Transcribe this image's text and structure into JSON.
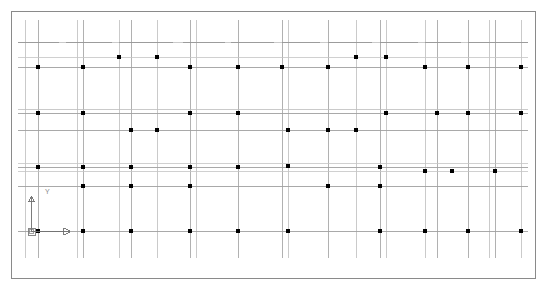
{
  "app": {
    "title": "CAD Structural Grid Drawing",
    "viewport_label": "model-space-viewport",
    "background_color": "#ffffff"
  },
  "viewport": {
    "width": 546,
    "height": 295,
    "border": {
      "x": 11,
      "y": 11,
      "width": 524,
      "height": 267,
      "color": "#8a8a8a",
      "stroke_width": 1
    }
  },
  "style": {
    "grid_line_color": "#b9b9b9",
    "beam_line_color": "#909090",
    "secondary_line_color": "#c9c9c9",
    "column_marker_color": "#000000",
    "ucs_icon_color": "#7a7a7a",
    "ucs_axis_color": "#6e6e6e"
  },
  "ucs_icon": {
    "name": "ucs-coordinate-icon",
    "origin_x": 31,
    "origin_y": 231,
    "x_axis_length": 38,
    "y_axis_length": 36,
    "x_label": "",
    "y_label": "Y",
    "label_y_x": 45,
    "label_y_y": 194
  },
  "grid": {
    "vertical_lines": [
      {
        "x": 25,
        "y1": 20,
        "y2": 258,
        "w": 0.8,
        "c": "#bdbdbd"
      },
      {
        "x": 38,
        "y1": 20,
        "y2": 258,
        "w": 0.9,
        "c": "#a8a8a8"
      },
      {
        "x": 77,
        "y1": 20,
        "y2": 258,
        "w": 0.8,
        "c": "#bdbdbd"
      },
      {
        "x": 83,
        "y1": 20,
        "y2": 258,
        "w": 0.9,
        "c": "#a8a8a8"
      },
      {
        "x": 119,
        "y1": 20,
        "y2": 258,
        "w": 0.8,
        "c": "#bdbdbd"
      },
      {
        "x": 131,
        "y1": 20,
        "y2": 258,
        "w": 0.9,
        "c": "#a8a8a8"
      },
      {
        "x": 157,
        "y1": 20,
        "y2": 258,
        "w": 0.8,
        "c": "#bdbdbd"
      },
      {
        "x": 190,
        "y1": 20,
        "y2": 258,
        "w": 0.9,
        "c": "#a8a8a8"
      },
      {
        "x": 196,
        "y1": 20,
        "y2": 258,
        "w": 0.8,
        "c": "#bdbdbd"
      },
      {
        "x": 238,
        "y1": 20,
        "y2": 258,
        "w": 0.9,
        "c": "#a8a8a8"
      },
      {
        "x": 282,
        "y1": 20,
        "y2": 258,
        "w": 0.9,
        "c": "#a8a8a8"
      },
      {
        "x": 288,
        "y1": 20,
        "y2": 258,
        "w": 0.8,
        "c": "#bdbdbd"
      },
      {
        "x": 328,
        "y1": 20,
        "y2": 258,
        "w": 0.9,
        "c": "#a8a8a8"
      },
      {
        "x": 356,
        "y1": 20,
        "y2": 258,
        "w": 0.8,
        "c": "#bdbdbd"
      },
      {
        "x": 380,
        "y1": 20,
        "y2": 258,
        "w": 0.9,
        "c": "#a8a8a8"
      },
      {
        "x": 386,
        "y1": 20,
        "y2": 258,
        "w": 0.8,
        "c": "#bdbdbd"
      },
      {
        "x": 425,
        "y1": 20,
        "y2": 258,
        "w": 0.8,
        "c": "#bdbdbd"
      },
      {
        "x": 437,
        "y1": 20,
        "y2": 258,
        "w": 0.9,
        "c": "#a8a8a8"
      },
      {
        "x": 468,
        "y1": 20,
        "y2": 258,
        "w": 0.9,
        "c": "#a8a8a8"
      },
      {
        "x": 489,
        "y1": 20,
        "y2": 258,
        "w": 0.8,
        "c": "#bdbdbd"
      },
      {
        "x": 495,
        "y1": 20,
        "y2": 258,
        "w": 0.9,
        "c": "#a8a8a8"
      },
      {
        "x": 521,
        "y1": 20,
        "y2": 258,
        "w": 0.8,
        "c": "#bdbdbd"
      }
    ],
    "horizontal_lines": [
      {
        "y": 42,
        "x1": 18,
        "x2": 528,
        "w": 0.8,
        "c": "#bdbdbd"
      },
      {
        "y": 57,
        "x1": 18,
        "x2": 528,
        "w": 0.8,
        "c": "#c4c4c4"
      },
      {
        "y": 67,
        "x1": 18,
        "x2": 528,
        "w": 0.9,
        "c": "#a0a0a0"
      },
      {
        "y": 109,
        "x1": 18,
        "x2": 528,
        "w": 0.8,
        "c": "#bdbdbd"
      },
      {
        "y": 113,
        "x1": 18,
        "x2": 528,
        "w": 0.9,
        "c": "#a0a0a0"
      },
      {
        "y": 130,
        "x1": 18,
        "x2": 528,
        "w": 0.9,
        "c": "#a0a0a0"
      },
      {
        "y": 163,
        "x1": 18,
        "x2": 528,
        "w": 0.8,
        "c": "#c4c4c4"
      },
      {
        "y": 167,
        "x1": 18,
        "x2": 528,
        "w": 0.9,
        "c": "#a0a0a0"
      },
      {
        "y": 171,
        "x1": 18,
        "x2": 528,
        "w": 0.8,
        "c": "#c4c4c4"
      },
      {
        "y": 186,
        "x1": 18,
        "x2": 528,
        "w": 0.9,
        "c": "#a0a0a0"
      },
      {
        "y": 231,
        "x1": 18,
        "x2": 528,
        "w": 0.9,
        "c": "#a0a0a0"
      }
    ],
    "column_markers": [
      {
        "x": 38,
        "y": 67
      },
      {
        "x": 83,
        "y": 67
      },
      {
        "x": 119,
        "y": 57
      },
      {
        "x": 157,
        "y": 57
      },
      {
        "x": 190,
        "y": 67
      },
      {
        "x": 238,
        "y": 67
      },
      {
        "x": 282,
        "y": 67
      },
      {
        "x": 328,
        "y": 67
      },
      {
        "x": 356,
        "y": 57
      },
      {
        "x": 386,
        "y": 57
      },
      {
        "x": 425,
        "y": 67
      },
      {
        "x": 468,
        "y": 67
      },
      {
        "x": 521,
        "y": 67
      },
      {
        "x": 38,
        "y": 113
      },
      {
        "x": 83,
        "y": 113
      },
      {
        "x": 131,
        "y": 130
      },
      {
        "x": 157,
        "y": 130
      },
      {
        "x": 190,
        "y": 113
      },
      {
        "x": 238,
        "y": 113
      },
      {
        "x": 288,
        "y": 130
      },
      {
        "x": 328,
        "y": 130
      },
      {
        "x": 356,
        "y": 130
      },
      {
        "x": 386,
        "y": 113
      },
      {
        "x": 437,
        "y": 113
      },
      {
        "x": 468,
        "y": 113
      },
      {
        "x": 521,
        "y": 113
      },
      {
        "x": 38,
        "y": 167
      },
      {
        "x": 83,
        "y": 167
      },
      {
        "x": 131,
        "y": 167
      },
      {
        "x": 190,
        "y": 167
      },
      {
        "x": 238,
        "y": 167
      },
      {
        "x": 288,
        "y": 166
      },
      {
        "x": 380,
        "y": 167
      },
      {
        "x": 425,
        "y": 171
      },
      {
        "x": 452,
        "y": 171
      },
      {
        "x": 495,
        "y": 171
      },
      {
        "x": 83,
        "y": 186
      },
      {
        "x": 131,
        "y": 186
      },
      {
        "x": 190,
        "y": 186
      },
      {
        "x": 328,
        "y": 186
      },
      {
        "x": 380,
        "y": 186
      },
      {
        "x": 38,
        "y": 231
      },
      {
        "x": 83,
        "y": 231
      },
      {
        "x": 131,
        "y": 231
      },
      {
        "x": 190,
        "y": 231
      },
      {
        "x": 238,
        "y": 231
      },
      {
        "x": 288,
        "y": 231
      },
      {
        "x": 380,
        "y": 231
      },
      {
        "x": 425,
        "y": 231
      },
      {
        "x": 468,
        "y": 231
      },
      {
        "x": 521,
        "y": 231
      }
    ],
    "beam_segments": [
      {
        "x1": 18,
        "y1": 42,
        "x2": 59,
        "y2": 42
      },
      {
        "x1": 66,
        "y1": 42,
        "x2": 112,
        "y2": 42
      },
      {
        "x1": 119,
        "y1": 42,
        "x2": 173,
        "y2": 42
      },
      {
        "x1": 183,
        "y1": 42,
        "x2": 225,
        "y2": 42
      },
      {
        "x1": 231,
        "y1": 42,
        "x2": 274,
        "y2": 42
      },
      {
        "x1": 282,
        "y1": 42,
        "x2": 320,
        "y2": 42
      },
      {
        "x1": 328,
        "y1": 42,
        "x2": 372,
        "y2": 42
      },
      {
        "x1": 380,
        "y1": 42,
        "x2": 418,
        "y2": 42
      },
      {
        "x1": 425,
        "y1": 42,
        "x2": 461,
        "y2": 42
      },
      {
        "x1": 468,
        "y1": 42,
        "x2": 513,
        "y2": 42
      },
      {
        "x1": 513,
        "y1": 42,
        "x2": 528,
        "y2": 42
      }
    ],
    "row_bands": [
      {
        "label": "band-1-roof",
        "y_top": 42,
        "y_bottom": 67
      },
      {
        "label": "band-2-level3",
        "y_top": 109,
        "y_bottom": 130
      },
      {
        "label": "band-3-level2",
        "y_top": 163,
        "y_bottom": 186
      },
      {
        "label": "band-4-ground",
        "y_top": 231,
        "y_bottom": 231
      }
    ]
  }
}
